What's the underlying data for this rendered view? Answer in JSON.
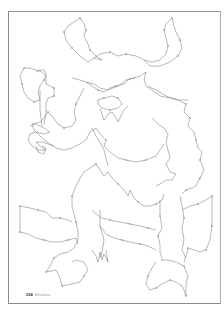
{
  "page": {
    "type": "dot-to-dot puzzle page",
    "page_number": "294",
    "footer_caption": "Minotaur"
  },
  "colors": {
    "line": "#6e6e6e",
    "dot": "#8a8a8a",
    "frame": "#8a8a8a",
    "background": "#ffffff"
  }
}
